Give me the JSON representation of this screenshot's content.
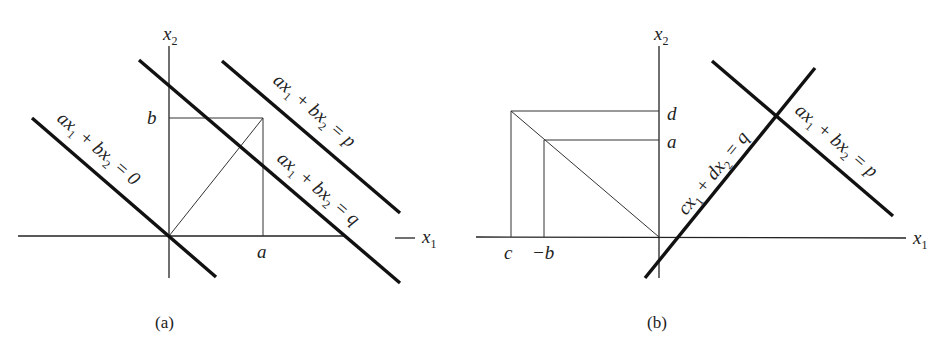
{
  "figure": {
    "panels": [
      {
        "id": "a",
        "caption": "(a)",
        "axes": {
          "x_label": "x",
          "x_sub": "1",
          "x_dash": "—",
          "y_label": "x",
          "y_sub": "2"
        },
        "ticks": {
          "x_tick": "a",
          "y_tick": "b"
        },
        "lines": [
          {
            "name": "line-zero",
            "parts": [
              "ax",
              "1",
              " + bx",
              "2",
              " = 0"
            ]
          },
          {
            "name": "line-q",
            "parts": [
              "ax",
              "1",
              " + bx",
              "2",
              " = q"
            ]
          },
          {
            "name": "line-p",
            "parts": [
              "ax",
              "1",
              " + bx",
              "2",
              " = p"
            ]
          }
        ]
      },
      {
        "id": "b",
        "caption": "(b)",
        "axes": {
          "x_label": "x",
          "x_sub": "1",
          "y_label": "x",
          "y_sub": "2"
        },
        "ticks": {
          "x_tick_c": "c",
          "x_tick_negb": "−b",
          "y_tick_d": "d",
          "y_tick_a": "a"
        },
        "lines": [
          {
            "name": "line-q",
            "parts": [
              "cx",
              "1",
              " + dx",
              "2",
              " = q"
            ]
          },
          {
            "name": "line-p",
            "parts": [
              "ax",
              "1",
              " + bx",
              "2",
              " = p"
            ]
          }
        ]
      }
    ]
  }
}
